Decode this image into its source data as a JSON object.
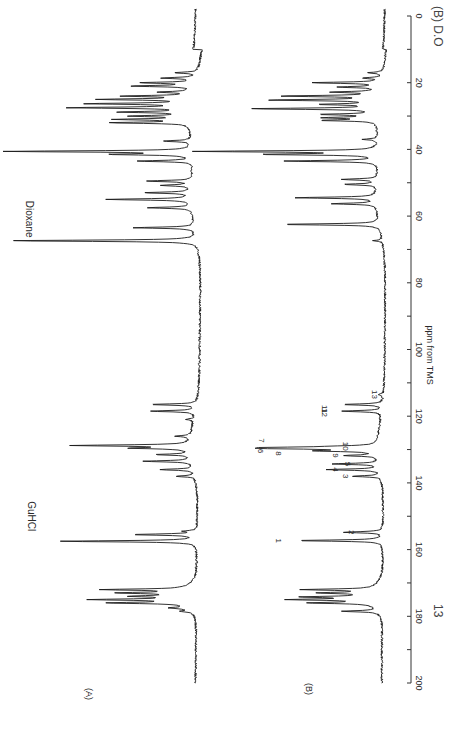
{
  "chart_data": {
    "type": "line",
    "orientation": "rotated-90 (ppm axis vertical on right, intensity increases leftward)",
    "xlabel": "ppm from TMS",
    "ylabel": "",
    "xlim": [
      0,
      200
    ],
    "x_ticks": [
      0,
      20,
      40,
      60,
      80,
      100,
      120,
      140,
      160,
      180,
      200
    ],
    "x_tick_labels": [
      "0",
      "20",
      "40",
      "60",
      "80",
      "100",
      "120",
      "140",
      "160",
      "180",
      "200"
    ],
    "grid": false,
    "caption_partial": "13 ... (B) D2O",
    "series": [
      {
        "name": "(A)",
        "annotations": [
          {
            "text": "GuHCl",
            "ppm": 157.5
          },
          {
            "text": "Dioxane",
            "ppm": 67.4
          }
        ],
        "peaks": [
          {
            "ppm": 17.0,
            "intensity": 0.12
          },
          {
            "ppm": 18.6,
            "intensity": 0.18
          },
          {
            "ppm": 20.0,
            "intensity": 0.28
          },
          {
            "ppm": 21.0,
            "intensity": 0.33
          },
          {
            "ppm": 22.8,
            "intensity": 0.17
          },
          {
            "ppm": 24.0,
            "intensity": 0.35
          },
          {
            "ppm": 25.0,
            "intensity": 0.47
          },
          {
            "ppm": 26.3,
            "intensity": 0.53
          },
          {
            "ppm": 27.5,
            "intensity": 0.62
          },
          {
            "ppm": 28.8,
            "intensity": 0.36
          },
          {
            "ppm": 30.0,
            "intensity": 0.3
          },
          {
            "ppm": 31.0,
            "intensity": 0.37
          },
          {
            "ppm": 32.0,
            "intensity": 0.41
          },
          {
            "ppm": 37.5,
            "intensity": 0.15
          },
          {
            "ppm": 40.6,
            "intensity": 0.98
          },
          {
            "ppm": 41.5,
            "intensity": 0.4
          },
          {
            "ppm": 43.5,
            "intensity": 0.29
          },
          {
            "ppm": 49.5,
            "intensity": 0.24
          },
          {
            "ppm": 50.8,
            "intensity": 0.16
          },
          {
            "ppm": 53.0,
            "intensity": 0.24
          },
          {
            "ppm": 55.0,
            "intensity": 0.45
          },
          {
            "ppm": 57.5,
            "intensity": 0.23
          },
          {
            "ppm": 63.5,
            "intensity": 0.32
          },
          {
            "ppm": 67.4,
            "intensity": 1.0
          },
          {
            "ppm": 116.5,
            "intensity": 0.24
          },
          {
            "ppm": 118.5,
            "intensity": 0.24
          },
          {
            "ppm": 121.0,
            "intensity": 0.04
          },
          {
            "ppm": 126.0,
            "intensity": 0.08
          },
          {
            "ppm": 128.8,
            "intensity": 0.62
          },
          {
            "ppm": 129.6,
            "intensity": 0.3
          },
          {
            "ppm": 131.5,
            "intensity": 0.18
          },
          {
            "ppm": 133.5,
            "intensity": 0.26
          },
          {
            "ppm": 136.0,
            "intensity": 0.18
          },
          {
            "ppm": 138.0,
            "intensity": 0.1
          },
          {
            "ppm": 154.5,
            "intensity": 0.06
          },
          {
            "ppm": 155.5,
            "intensity": 0.34
          },
          {
            "ppm": 157.5,
            "intensity": 0.72
          },
          {
            "ppm": 172.0,
            "intensity": 0.43
          },
          {
            "ppm": 173.0,
            "intensity": 0.33
          },
          {
            "ppm": 174.0,
            "intensity": 0.25
          },
          {
            "ppm": 175.0,
            "intensity": 0.46
          },
          {
            "ppm": 176.0,
            "intensity": 0.4
          },
          {
            "ppm": 177.5,
            "intensity": 0.1
          },
          {
            "ppm": 178.5,
            "intensity": 0.06
          }
        ]
      },
      {
        "name": "(B)",
        "annotations": [],
        "numbered_peaks": [
          {
            "label": "1",
            "ppm": 157.3
          },
          {
            "label": "2",
            "ppm": 154.8
          },
          {
            "label": "3",
            "ppm": 138.0
          },
          {
            "label": "4",
            "ppm": 136.0
          },
          {
            "label": "5",
            "ppm": 134.3
          },
          {
            "label": "6",
            "ppm": 130.4
          },
          {
            "label": "7",
            "ppm": 129.7
          },
          {
            "label": "8",
            "ppm": 129.4
          },
          {
            "label": "9",
            "ppm": 131.8
          },
          {
            "label": "10",
            "ppm": 129.0
          },
          {
            "label": "11",
            "ppm": 118.5
          },
          {
            "label": "12",
            "ppm": 116.5
          },
          {
            "label": "13",
            "ppm": 113.5
          }
        ],
        "peaks": [
          {
            "ppm": 17.0,
            "intensity": 0.08
          },
          {
            "ppm": 18.6,
            "intensity": 0.1
          },
          {
            "ppm": 20.0,
            "intensity": 0.38
          },
          {
            "ppm": 21.3,
            "intensity": 0.22
          },
          {
            "ppm": 22.8,
            "intensity": 0.25
          },
          {
            "ppm": 24.0,
            "intensity": 0.53
          },
          {
            "ppm": 25.2,
            "intensity": 0.6
          },
          {
            "ppm": 26.5,
            "intensity": 0.3
          },
          {
            "ppm": 27.8,
            "intensity": 0.7
          },
          {
            "ppm": 29.5,
            "intensity": 0.3
          },
          {
            "ppm": 30.5,
            "intensity": 0.28
          },
          {
            "ppm": 31.3,
            "intensity": 0.3
          },
          {
            "ppm": 37.0,
            "intensity": 0.08
          },
          {
            "ppm": 40.6,
            "intensity": 1.0
          },
          {
            "ppm": 41.5,
            "intensity": 0.62
          },
          {
            "ppm": 43.5,
            "intensity": 0.52
          },
          {
            "ppm": 49.0,
            "intensity": 0.2
          },
          {
            "ppm": 50.5,
            "intensity": 0.18
          },
          {
            "ppm": 54.5,
            "intensity": 0.45
          },
          {
            "ppm": 56.3,
            "intensity": 0.25
          },
          {
            "ppm": 62.5,
            "intensity": 0.55
          },
          {
            "ppm": 67.4,
            "intensity": 0.05
          },
          {
            "ppm": 113.5,
            "intensity": 0.03
          },
          {
            "ppm": 116.5,
            "intensity": 0.22
          },
          {
            "ppm": 118.5,
            "intensity": 0.22
          },
          {
            "ppm": 129.0,
            "intensity": 0.12
          },
          {
            "ppm": 129.4,
            "intensity": 0.45
          },
          {
            "ppm": 129.7,
            "intensity": 0.48
          },
          {
            "ppm": 130.4,
            "intensity": 0.3
          },
          {
            "ppm": 131.8,
            "intensity": 0.18
          },
          {
            "ppm": 134.3,
            "intensity": 0.26
          },
          {
            "ppm": 136.0,
            "intensity": 0.3
          },
          {
            "ppm": 138.0,
            "intensity": 0.16
          },
          {
            "ppm": 154.8,
            "intensity": 0.22
          },
          {
            "ppm": 157.3,
            "intensity": 0.48
          },
          {
            "ppm": 172.0,
            "intensity": 0.38
          },
          {
            "ppm": 173.0,
            "intensity": 0.28
          },
          {
            "ppm": 174.2,
            "intensity": 0.36
          },
          {
            "ppm": 175.0,
            "intensity": 0.43
          },
          {
            "ppm": 176.0,
            "intensity": 0.35
          },
          {
            "ppm": 178.5,
            "intensity": 0.2
          }
        ]
      }
    ]
  },
  "labels": {
    "panel_a": "(A)",
    "panel_b": "(B)",
    "guhcl": "GuHCl",
    "dioxane": "Dioxane",
    "axis_title": "ppm from TMS",
    "caption_13": "13",
    "caption_tail": "(B) D.O"
  }
}
